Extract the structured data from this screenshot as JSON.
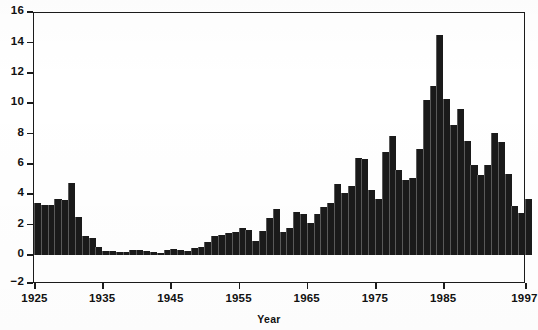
{
  "figure": {
    "background_color": "#ffffff",
    "frame_color": "#1b1b1b",
    "bar_color": "#1a1a1a"
  },
  "axis": {
    "x_title": "Year",
    "y_ticks": [
      "16",
      "14",
      "12",
      "10",
      "8",
      "6",
      "4",
      "2",
      "0",
      "−2"
    ],
    "x_ticks": [
      "1925",
      "1935",
      "1945",
      "1955",
      "1965",
      "1975",
      "1985",
      "1997"
    ]
  },
  "chart_data": {
    "type": "bar",
    "title": "",
    "subtitle": "",
    "xlabel": "Year",
    "ylabel": "",
    "xlim": [
      1925,
      1997
    ],
    "ylim": [
      -2,
      16
    ],
    "grid": false,
    "legend": "none",
    "y_tick_values": [
      16,
      14,
      12,
      10,
      8,
      6,
      4,
      2,
      0,
      -2
    ],
    "x_tick_values": [
      1925,
      1935,
      1945,
      1955,
      1965,
      1975,
      1985,
      1997
    ],
    "categories": [
      1925,
      1926,
      1927,
      1928,
      1929,
      1930,
      1931,
      1932,
      1933,
      1934,
      1935,
      1936,
      1937,
      1938,
      1939,
      1940,
      1941,
      1942,
      1943,
      1944,
      1945,
      1946,
      1947,
      1948,
      1949,
      1950,
      1951,
      1952,
      1953,
      1954,
      1955,
      1956,
      1957,
      1958,
      1959,
      1960,
      1961,
      1962,
      1963,
      1964,
      1965,
      1966,
      1967,
      1968,
      1969,
      1970,
      1971,
      1972,
      1973,
      1974,
      1975,
      1976,
      1977,
      1978,
      1979,
      1980,
      1981,
      1982,
      1983,
      1984,
      1985,
      1986,
      1987,
      1988,
      1989,
      1990,
      1991,
      1992,
      1993,
      1994,
      1995,
      1996,
      1997
    ],
    "values": [
      3.4,
      3.3,
      3.3,
      3.7,
      3.6,
      4.75,
      2.5,
      1.25,
      1.15,
      0.5,
      0.25,
      0.25,
      0.2,
      0.2,
      0.35,
      0.3,
      0.25,
      0.2,
      0.15,
      0.3,
      0.4,
      0.35,
      0.25,
      0.45,
      0.5,
      0.85,
      1.25,
      1.3,
      1.45,
      1.5,
      1.8,
      1.65,
      0.95,
      1.55,
      2.45,
      3.05,
      1.5,
      1.75,
      2.85,
      2.7,
      2.1,
      2.7,
      3.15,
      3.45,
      4.65,
      4.1,
      4.55,
      6.4,
      6.35,
      4.25,
      3.7,
      6.8,
      7.85,
      5.6,
      4.95,
      5.05,
      6.95,
      10.2,
      11.1,
      14.5,
      10.3,
      8.55,
      9.6,
      7.5,
      5.9,
      5.25,
      5.9,
      8.05,
      7.45,
      5.35,
      3.2,
      2.75,
      3.7
    ],
    "max_value": 14.5,
    "max_value_year": 1984,
    "min_value": 0.15,
    "min_value_year": 1943
  }
}
